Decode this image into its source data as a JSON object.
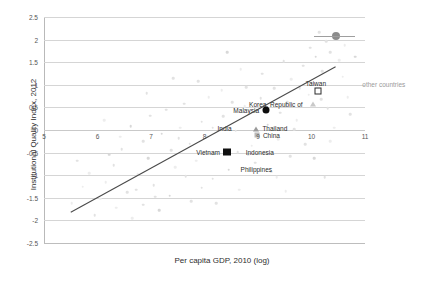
{
  "chart_data": {
    "type": "scatter",
    "title": "",
    "xlabel": "Per capita GDP, 2010 (log)",
    "ylabel": "Institutional Quality Index, 2012",
    "xlim": [
      5,
      11
    ],
    "ylim": [
      -2.5,
      2.5
    ],
    "xticks": [
      "5",
      "6",
      "7",
      "8",
      "9",
      "10",
      "11"
    ],
    "yticks": [
      "2.5",
      "2",
      "1.5",
      "1",
      "0.5",
      "0",
      "-0.5",
      "-1",
      "-1.5",
      "-2",
      "-2.5"
    ],
    "grid": "horizontal",
    "legend_position": "none",
    "annotations": [
      {
        "text": "other countries",
        "x": 10.95,
        "y": 1.02
      }
    ],
    "trendline": {
      "label": "linear fit",
      "x0": 5.5,
      "y0": -1.82,
      "x1": 10.45,
      "y1": 1.4
    },
    "series": [
      {
        "name": "highlighted economies",
        "marker": "mixed",
        "points": [
          {
            "label": "Taiwan",
            "x": 10.12,
            "y": 0.86,
            "marker": "open-square",
            "label_dx": -2,
            "label_dy": -8,
            "label_align": "center"
          },
          {
            "label": "Korea, Republic of",
            "x": 10.02,
            "y": 0.57,
            "marker": "triangle",
            "label_dx": -10,
            "label_dy": 0,
            "label_align": "right"
          },
          {
            "label": "Malaysia",
            "x": 9.15,
            "y": 0.45,
            "marker": "filled-circle",
            "label_dx": -7,
            "label_dy": 0,
            "label_align": "right"
          },
          {
            "label": "Thailand",
            "x": 8.97,
            "y": 0.03,
            "marker": "triangle-dark",
            "label_dx": 6,
            "label_dy": -1,
            "label_align": "left"
          },
          {
            "label": "China",
            "x": 8.98,
            "y": -0.12,
            "marker": "small-square",
            "label_dx": 6,
            "label_dy": 0,
            "label_align": "left"
          },
          {
            "label": "India",
            "x": 8.15,
            "y": 0.05,
            "marker": "cloud",
            "label_dx": 5,
            "label_dy": 0,
            "label_align": "left"
          },
          {
            "label": "Vietnam",
            "x": 8.42,
            "y": -0.49,
            "marker": "filled-square",
            "label_dx": -7,
            "label_dy": 0,
            "label_align": "right"
          },
          {
            "label": "Indonesia",
            "x": 8.62,
            "y": -0.49,
            "marker": "cloud",
            "label_dx": 8,
            "label_dy": 0,
            "label_align": "left"
          },
          {
            "label": "Philippines",
            "x": 8.6,
            "y": -0.68,
            "marker": "none",
            "label_dx": 4,
            "label_dy": 8,
            "label_align": "left"
          }
        ]
      },
      {
        "name": "other countries",
        "marker": "cloud",
        "points": [
          {
            "x": 10.46,
            "y": 2.09,
            "marker": "gray-circle"
          },
          {
            "x": 10.14,
            "y": 2.17
          },
          {
            "x": 10.28,
            "y": 1.96
          },
          {
            "x": 10.62,
            "y": 1.88
          },
          {
            "x": 10.35,
            "y": 1.72
          },
          {
            "x": 10.08,
            "y": 1.62
          },
          {
            "x": 10.52,
            "y": 1.55
          },
          {
            "x": 9.85,
            "y": 1.42
          },
          {
            "x": 10.2,
            "y": 1.3
          },
          {
            "x": 9.62,
            "y": 1.12
          },
          {
            "x": 10.0,
            "y": 1.05
          },
          {
            "x": 9.3,
            "y": 0.92
          },
          {
            "x": 9.95,
            "y": 0.78
          },
          {
            "x": 9.05,
            "y": 0.7
          },
          {
            "x": 9.55,
            "y": 0.62
          },
          {
            "x": 8.75,
            "y": 0.52
          },
          {
            "x": 9.42,
            "y": 0.38
          },
          {
            "x": 8.35,
            "y": 0.3
          },
          {
            "x": 9.72,
            "y": 0.22
          },
          {
            "x": 7.95,
            "y": 0.18
          },
          {
            "x": 9.18,
            "y": 0.12
          },
          {
            "x": 7.55,
            "y": 0.05
          },
          {
            "x": 8.58,
            "y": -0.02
          },
          {
            "x": 10.3,
            "y": 0.48
          },
          {
            "x": 10.68,
            "y": 0.72
          },
          {
            "x": 7.2,
            "y": -0.08
          },
          {
            "x": 8.05,
            "y": -0.15
          },
          {
            "x": 9.38,
            "y": -0.2
          },
          {
            "x": 6.85,
            "y": -0.25
          },
          {
            "x": 7.72,
            "y": -0.3
          },
          {
            "x": 8.88,
            "y": -0.35
          },
          {
            "x": 6.45,
            "y": -0.42
          },
          {
            "x": 7.38,
            "y": -0.45
          },
          {
            "x": 8.25,
            "y": -0.52
          },
          {
            "x": 9.6,
            "y": -0.58
          },
          {
            "x": 6.95,
            "y": -0.62
          },
          {
            "x": 7.85,
            "y": -0.68
          },
          {
            "x": 8.95,
            "y": -0.72
          },
          {
            "x": 6.3,
            "y": -0.78
          },
          {
            "x": 7.45,
            "y": -0.82
          },
          {
            "x": 8.45,
            "y": -0.88
          },
          {
            "x": 9.25,
            "y": -0.92
          },
          {
            "x": 6.75,
            "y": -0.98
          },
          {
            "x": 7.65,
            "y": -1.02
          },
          {
            "x": 8.15,
            "y": -1.08
          },
          {
            "x": 6.15,
            "y": -1.15
          },
          {
            "x": 7.05,
            "y": -1.22
          },
          {
            "x": 7.95,
            "y": -1.28
          },
          {
            "x": 8.65,
            "y": -1.32
          },
          {
            "x": 6.55,
            "y": -1.38
          },
          {
            "x": 7.35,
            "y": -1.45
          },
          {
            "x": 6.05,
            "y": -1.52
          },
          {
            "x": 7.75,
            "y": -1.58
          },
          {
            "x": 6.85,
            "y": -1.65
          },
          {
            "x": 6.35,
            "y": -1.72
          },
          {
            "x": 7.15,
            "y": -1.78
          },
          {
            "x": 5.95,
            "y": -1.88
          },
          {
            "x": 6.65,
            "y": -1.95
          },
          {
            "x": 8.52,
            "y": 0.62
          },
          {
            "x": 9.88,
            "y": -0.32
          },
          {
            "x": 10.42,
            "y": 0.05
          },
          {
            "x": 8.78,
            "y": 0.95
          },
          {
            "x": 9.48,
            "y": 1.52
          },
          {
            "x": 10.58,
            "y": 1.18
          },
          {
            "x": 7.28,
            "y": 0.45
          },
          {
            "x": 6.62,
            "y": 0.08
          },
          {
            "x": 8.08,
            "y": 0.72
          },
          {
            "x": 9.08,
            "y": 1.25
          },
          {
            "x": 10.72,
            "y": 0.35
          },
          {
            "x": 5.72,
            "y": -1.25
          },
          {
            "x": 6.22,
            "y": -0.55
          },
          {
            "x": 7.52,
            "y": -0.18
          },
          {
            "x": 8.32,
            "y": 0.88
          },
          {
            "x": 9.78,
            "y": 0.92
          },
          {
            "x": 10.18,
            "y": 0.68
          },
          {
            "x": 5.85,
            "y": -0.95
          },
          {
            "x": 6.98,
            "y": 0.32
          },
          {
            "x": 7.88,
            "y": 1.08
          },
          {
            "x": 8.68,
            "y": 1.35
          },
          {
            "x": 9.98,
            "y": 1.82
          },
          {
            "x": 10.82,
            "y": 1.62
          },
          {
            "x": 6.42,
            "y": -0.15
          },
          {
            "x": 7.62,
            "y": 0.58
          },
          {
            "x": 8.82,
            "y": -0.55
          },
          {
            "x": 9.35,
            "y": -1.05
          },
          {
            "x": 10.05,
            "y": -0.62
          },
          {
            "x": 5.62,
            "y": -0.68
          },
          {
            "x": 6.12,
            "y": 0.22
          },
          {
            "x": 7.08,
            "y": -1.48
          },
          {
            "x": 8.22,
            "y": -1.62
          },
          {
            "x": 9.52,
            "y": -1.35
          },
          {
            "x": 10.25,
            "y": -1.05
          },
          {
            "x": 6.72,
            "y": -1.32
          },
          {
            "x": 5.52,
            "y": -1.62
          },
          {
            "x": 9.68,
            "y": 0.02
          },
          {
            "x": 8.42,
            "y": 1.72
          },
          {
            "x": 10.35,
            "y": -0.25
          },
          {
            "x": 7.42,
            "y": 1.15
          },
          {
            "x": 6.92,
            "y": 0.82
          }
        ]
      }
    ],
    "legend_marker": {
      "label": "other countries",
      "marker": "gray-circle",
      "rule_x0": 10.04,
      "rule_x1": 10.82,
      "rule_y": 2.09
    }
  }
}
